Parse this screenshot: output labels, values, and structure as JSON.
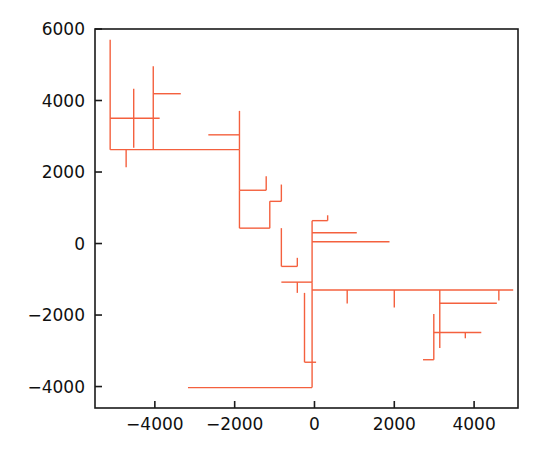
{
  "figure": {
    "type": "scatter-segments",
    "background": "#ffffff",
    "series_color": "#f4603e",
    "axis_color": "#1a1a1a",
    "frame": {
      "left": 95,
      "top": 29,
      "right": 518,
      "bottom": 408
    }
  },
  "chart_data": {
    "type": "line",
    "title": "",
    "xlabel": "",
    "ylabel": "",
    "xlim": [
      -5500,
      5100
    ],
    "ylim": [
      -4600,
      6000
    ],
    "grid": false,
    "legend": null,
    "xticks": [
      -4000,
      -2000,
      0,
      2000,
      4000
    ],
    "xticklabels": [
      "−4000",
      "−2000",
      "0",
      "2000",
      "4000"
    ],
    "yticks": [
      -4000,
      -2000,
      0,
      2000,
      4000,
      6000
    ],
    "yticklabels": [
      "−4000",
      "−2000",
      "0",
      "2000",
      "4000",
      "6000"
    ],
    "series": [
      {
        "name": "segments",
        "color": "#f4603e",
        "linewidth": 1.4,
        "segments": [
          [
            -5120,
            5700,
            -5120,
            2625
          ],
          [
            -4530,
            4330,
            -4530,
            2680
          ],
          [
            -4040,
            4960,
            -4040,
            2625
          ],
          [
            -4040,
            4190,
            -3350,
            4190
          ],
          [
            -5120,
            3505,
            -3880,
            3505
          ],
          [
            -5120,
            2625,
            -1880,
            2625
          ],
          [
            -4720,
            2625,
            -4720,
            2135
          ],
          [
            -2660,
            3040,
            -1880,
            3040
          ],
          [
            -1880,
            3710,
            -1880,
            2625
          ],
          [
            -1880,
            2625,
            -1880,
            1490
          ],
          [
            -1880,
            1490,
            -1210,
            1490
          ],
          [
            -1210,
            1490,
            -1210,
            1880
          ],
          [
            -1880,
            1490,
            -1880,
            430
          ],
          [
            -1880,
            430,
            -1120,
            430
          ],
          [
            -1120,
            430,
            -1120,
            1180
          ],
          [
            -1120,
            1180,
            -830,
            1180
          ],
          [
            -830,
            1180,
            -830,
            1650
          ],
          [
            -830,
            430,
            -830,
            -640
          ],
          [
            -830,
            -640,
            -430,
            -640
          ],
          [
            -430,
            -640,
            -430,
            -400
          ],
          [
            -830,
            -1080,
            -60,
            -1080
          ],
          [
            -430,
            -1080,
            -430,
            -1380
          ],
          [
            -60,
            640,
            -60,
            -1080
          ],
          [
            -60,
            640,
            330,
            640
          ],
          [
            330,
            640,
            330,
            790
          ],
          [
            -60,
            300,
            1060,
            300
          ],
          [
            -60,
            50,
            1880,
            50
          ],
          [
            -60,
            -1080,
            -60,
            -4030
          ],
          [
            -250,
            -1380,
            -250,
            -3320
          ],
          [
            -250,
            -3320,
            40,
            -3320
          ],
          [
            -3170,
            -4030,
            -60,
            -4030
          ],
          [
            -60,
            -1300,
            4980,
            -1300
          ],
          [
            820,
            -1300,
            820,
            -1680
          ],
          [
            2000,
            -1300,
            2000,
            -1790
          ],
          [
            3140,
            -1300,
            3140,
            -2920
          ],
          [
            3140,
            -1670,
            4570,
            -1670
          ],
          [
            2990,
            -1970,
            2990,
            -3250
          ],
          [
            2990,
            -2490,
            4180,
            -2490
          ],
          [
            3780,
            -2490,
            3780,
            -2650
          ],
          [
            2720,
            -3250,
            2990,
            -3250
          ],
          [
            4620,
            -1300,
            4620,
            -1590
          ]
        ]
      }
    ]
  }
}
